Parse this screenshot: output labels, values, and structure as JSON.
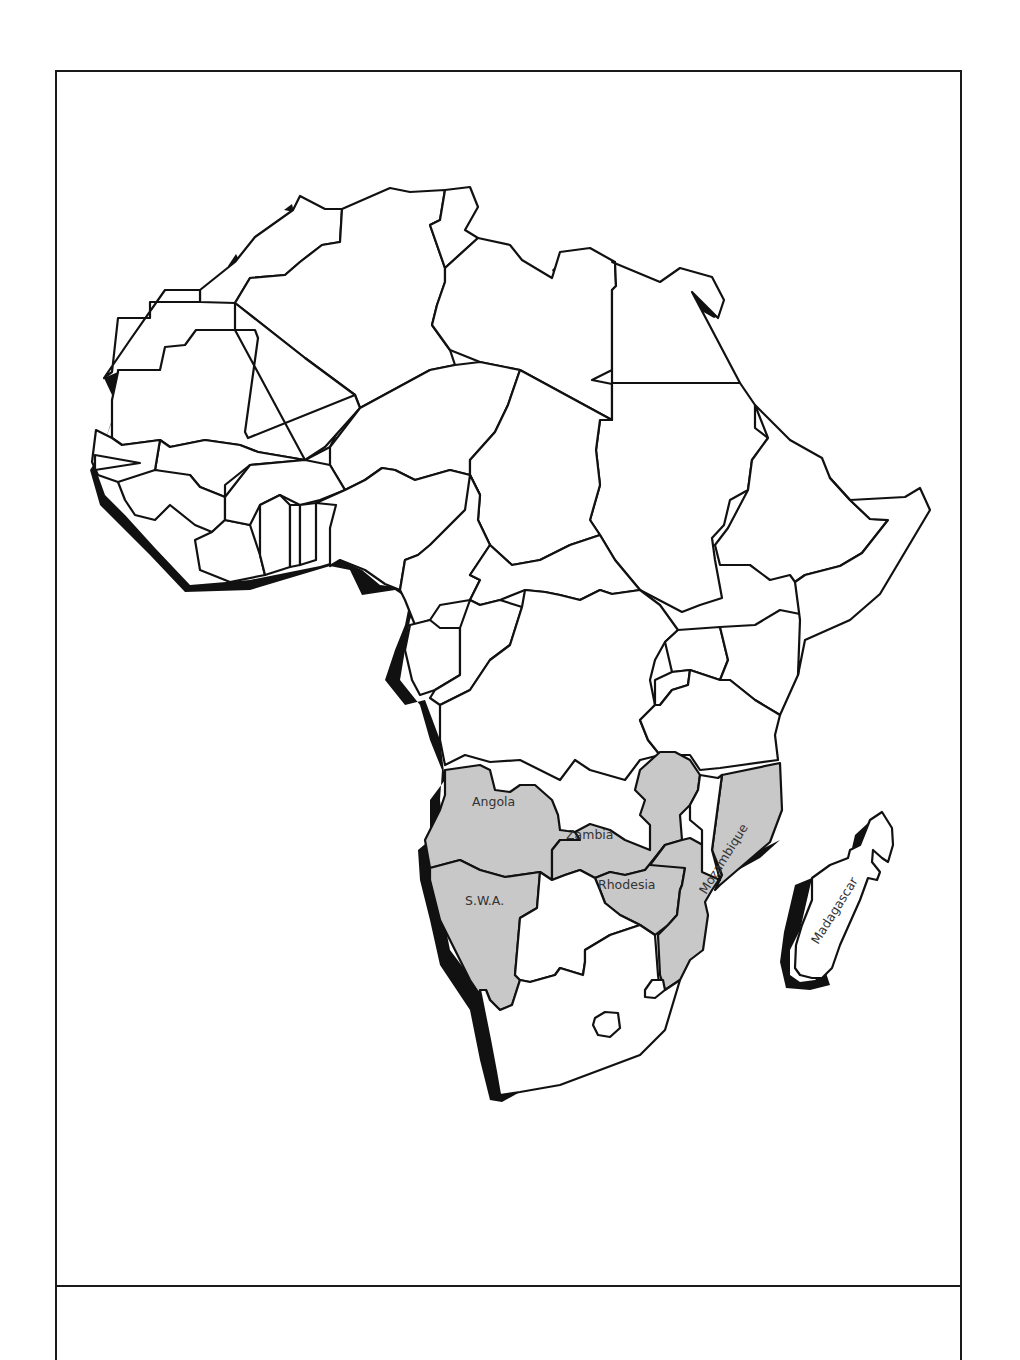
{
  "map": {
    "title": "",
    "region": "Africa",
    "colors": {
      "highlight": "#c8c8c8",
      "land": "#ffffff",
      "border": "#111111",
      "coast_shadow": "#111111"
    },
    "labels": {
      "angola": "Angola",
      "zambia": "Zambia",
      "rhodesia": "Rhodesia",
      "swa": "S.W.A.",
      "mozambique": "Mozambique",
      "madagascar": "Madagascar"
    },
    "highlighted_regions": [
      "Angola",
      "Zambia",
      "Rhodesia",
      "S.W.A.",
      "Mozambique"
    ]
  },
  "caption": {
    "text": ""
  }
}
